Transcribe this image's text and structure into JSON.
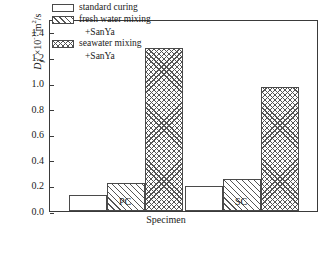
{
  "chart_data": {
    "type": "bar",
    "title": "",
    "subtitle": "",
    "xlabel": "Specimen",
    "ylabel": "Df / ×10-11 m2/s",
    "ylabel_parts": {
      "symbol": "D",
      "subscript": "f",
      "rest": "/ ×10",
      "exponent": "-11",
      "units": "m",
      "units_exp": "2",
      "units_tail": "/s"
    },
    "categories": [
      "PC",
      "SC"
    ],
    "series": [
      {
        "name": "standard curing",
        "values": [
          0.125,
          0.195
        ],
        "fill": "plain"
      },
      {
        "name": "fresh water mixing +SanYa",
        "values": [
          0.22,
          0.25
        ],
        "fill": "diagonal-hatch"
      },
      {
        "name": "seawater mixing +SanYa",
        "values": [
          1.27,
          0.97
        ],
        "fill": "cross-hatch"
      }
    ],
    "yticks": [
      "0.0",
      "0.2",
      "0.4",
      "0.6",
      "0.8",
      "1.0",
      "1.2",
      "1.4"
    ],
    "ytick_values": [
      0.0,
      0.2,
      0.4,
      0.6,
      0.8,
      1.0,
      1.2,
      1.4
    ],
    "ylim": [
      0.0,
      1.5
    ],
    "grid": false,
    "legend_position": "upper-left"
  },
  "legend": {
    "entries": [
      {
        "label": "standard curing",
        "continuation": "",
        "swatch": "plain"
      },
      {
        "label": "fresh water mixing",
        "continuation": "+SanYa",
        "swatch": "diagonal-hatch"
      },
      {
        "label": "seawater mixing",
        "continuation": "+SanYa",
        "swatch": "cross-hatch"
      }
    ]
  },
  "axes": {
    "x_label": "Specimen",
    "x_ticks": [
      "PC",
      "SC"
    ]
  },
  "colors": {
    "axis": "#3a3a3a",
    "bar_edge": "#4a4a4a",
    "hatch": "#555555",
    "background": "#ffffff",
    "text": "#1a1a1a"
  }
}
